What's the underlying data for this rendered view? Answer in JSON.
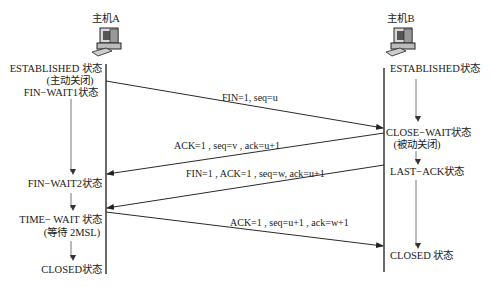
{
  "hosts": {
    "a": {
      "label": "主机A"
    },
    "b": {
      "label": "主机B"
    }
  },
  "states_a": [
    {
      "id": "established",
      "lines": [
        "ESTABLISHED 状态",
        "(主动关闭)"
      ]
    },
    {
      "id": "fin_wait1",
      "lines": [
        "FIN−WAIT1状态"
      ]
    },
    {
      "id": "fin_wait2",
      "lines": [
        "FIN−WAIT2状态"
      ]
    },
    {
      "id": "time_wait",
      "lines": [
        "TIME− WAIT 状态",
        "(等待 2MSL)"
      ]
    },
    {
      "id": "closed",
      "lines": [
        "CLOSED状态"
      ]
    }
  ],
  "states_b": [
    {
      "id": "established",
      "lines": [
        "ESTABLISHED状态"
      ]
    },
    {
      "id": "close_wait",
      "lines": [
        "CLOSE−WAIT状态",
        "(被动关闭)"
      ]
    },
    {
      "id": "last_ack",
      "lines": [
        "LAST−ACK状态"
      ]
    },
    {
      "id": "closed",
      "lines": [
        "CLOSED 状态"
      ]
    }
  ],
  "messages": [
    {
      "id": "fin1",
      "label": "FIN=1, seq=u",
      "direction": "A→B"
    },
    {
      "id": "ack1",
      "label": "ACK=1 , seq=v , ack=u+1",
      "direction": "B→A"
    },
    {
      "id": "fin2",
      "label": "FIN=1 , ACK=1 , seq=w, ack=u+1",
      "direction": "B→A"
    },
    {
      "id": "ack2",
      "label": "ACK=1 , seq=u+1 , ack=w+1",
      "direction": "A→B"
    }
  ]
}
